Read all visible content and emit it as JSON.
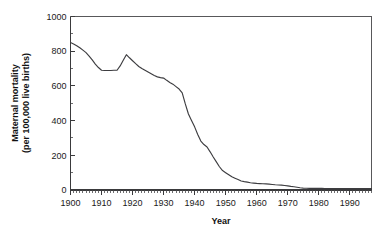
{
  "chart_data": {
    "type": "line",
    "title": "",
    "xlabel": "Year",
    "ylabel": "Maternal mortality\n(per 100,000 live births)",
    "ylabel_line1": "Maternal mortality",
    "ylabel_line2": "(per 100,000 live births)",
    "xlim": [
      1900,
      1997
    ],
    "ylim": [
      0,
      1000
    ],
    "grid": false,
    "legend": false,
    "line_color": "#3d3d40",
    "x_tick_labels": [
      "1900",
      "1910",
      "1920",
      "1930",
      "1940",
      "1950",
      "1960",
      "1970",
      "1980",
      "1990"
    ],
    "x_tick_values": [
      1900,
      1910,
      1920,
      1930,
      1940,
      1950,
      1960,
      1970,
      1980,
      1990
    ],
    "x_minor_step": 1,
    "y_tick_labels": [
      "0",
      "200",
      "400",
      "600",
      "800",
      "1000"
    ],
    "y_tick_values": [
      0,
      200,
      400,
      600,
      800,
      1000
    ],
    "y_minor_step": 100,
    "series": [
      {
        "name": "Maternal mortality rate",
        "x": [
          1900,
          1901,
          1902,
          1903,
          1904,
          1905,
          1906,
          1907,
          1908,
          1909,
          1910,
          1911,
          1912,
          1913,
          1914,
          1915,
          1916,
          1917,
          1918,
          1919,
          1920,
          1921,
          1922,
          1923,
          1924,
          1925,
          1926,
          1927,
          1928,
          1929,
          1930,
          1931,
          1932,
          1933,
          1934,
          1935,
          1936,
          1937,
          1938,
          1939,
          1940,
          1941,
          1942,
          1943,
          1944,
          1945,
          1946,
          1947,
          1948,
          1949,
          1950,
          1951,
          1952,
          1953,
          1954,
          1955,
          1956,
          1957,
          1958,
          1959,
          1960,
          1961,
          1962,
          1963,
          1964,
          1965,
          1966,
          1967,
          1968,
          1969,
          1970,
          1971,
          1972,
          1973,
          1974,
          1975,
          1976,
          1977,
          1978,
          1979,
          1980,
          1981,
          1982,
          1983,
          1984,
          1985,
          1986,
          1987,
          1988,
          1989,
          1990,
          1991,
          1992,
          1993,
          1994,
          1995,
          1996,
          1997
        ],
        "values": [
          850,
          842,
          832,
          820,
          806,
          792,
          772,
          750,
          726,
          706,
          690,
          689,
          689,
          689,
          690,
          690,
          715,
          748,
          780,
          762,
          745,
          728,
          712,
          700,
          690,
          680,
          670,
          660,
          652,
          648,
          645,
          632,
          620,
          610,
          596,
          582,
          560,
          496,
          438,
          400,
          364,
          320,
          282,
          262,
          248,
          220,
          190,
          162,
          134,
          112,
          100,
          88,
          76,
          68,
          60,
          52,
          48,
          45,
          42,
          40,
          38,
          37,
          36,
          35,
          34,
          32,
          30,
          29,
          28,
          26,
          24,
          21,
          19,
          16,
          13,
          11,
          10,
          9,
          9,
          9,
          9,
          9,
          8,
          8,
          8,
          8,
          8,
          8,
          8,
          8,
          8,
          8,
          8,
          8,
          8,
          8,
          8,
          8
        ]
      }
    ]
  },
  "axis_titles": {
    "x": "Year",
    "y_line1": "Maternal mortality",
    "y_line2": "(per 100,000 live births)"
  }
}
